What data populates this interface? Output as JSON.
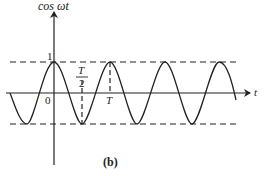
{
  "figure": {
    "caption": "(b)",
    "y_axis_label": "cos ωt",
    "x_axis_label": "t",
    "origin_label": "0",
    "amplitude_label": "1",
    "half_period_label": {
      "numerator": "T",
      "denominator": "2"
    },
    "period_label": "T",
    "curve": "cosine",
    "line_color": "#222222"
  }
}
